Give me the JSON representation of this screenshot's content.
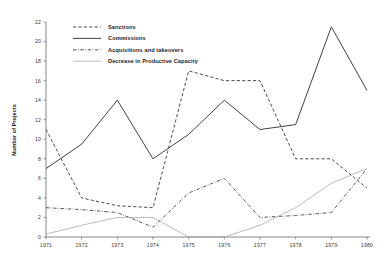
{
  "chart_data": {
    "type": "line",
    "title": "",
    "xlabel": "",
    "ylabel": "Number of Projects",
    "x": [
      1971,
      1972,
      1973,
      1974,
      1975,
      1976,
      1977,
      1978,
      1979,
      1980
    ],
    "categories": [
      "1971",
      "1972",
      "1973",
      "1974",
      "1975",
      "1976",
      "1977",
      "1978",
      "1979",
      "1980"
    ],
    "ylim": [
      0,
      22
    ],
    "ytick_values": [
      0,
      2,
      4,
      6,
      8,
      10,
      12,
      14,
      16,
      18,
      20,
      22
    ],
    "ytick_labels": [
      "0",
      "2",
      "4",
      "6",
      "8",
      "10",
      "12",
      "14",
      "16",
      "18",
      "20",
      "22"
    ],
    "grid": false,
    "legend_position": "top-center",
    "series": [
      {
        "name": "Sanctions",
        "style": "dashed",
        "color": "#2b2b2b",
        "values": [
          11,
          4,
          3.2,
          3,
          17,
          16,
          16,
          8,
          8,
          5
        ]
      },
      {
        "name": "Commissions",
        "style": "solid",
        "color": "#2b2b2b",
        "values": [
          7,
          9.5,
          14,
          8,
          10.5,
          14,
          11,
          11.5,
          21.5,
          15
        ]
      },
      {
        "name": "Acquisitions and takeovers",
        "style": "dash-dot",
        "color": "#2b2b2b",
        "values": [
          3,
          2.8,
          2.5,
          1,
          4.5,
          6,
          2,
          2.2,
          2.5,
          7
        ]
      },
      {
        "name": "Decrease in Productive Capacity",
        "style": "thin-solid",
        "color": "#8d8d8d",
        "values": [
          0.3,
          1.2,
          2,
          2,
          0,
          0,
          1.2,
          3,
          5.5,
          7
        ]
      }
    ]
  },
  "legend": {
    "items": [
      {
        "label": "Sanctions",
        "style": "dashed"
      },
      {
        "label": "Commissions",
        "style": "solid"
      },
      {
        "label": "Acquisitions and  takeovers",
        "style": "dash-dot"
      },
      {
        "label": "Decrease in Productive Capacity",
        "style": "thin-solid"
      }
    ]
  }
}
